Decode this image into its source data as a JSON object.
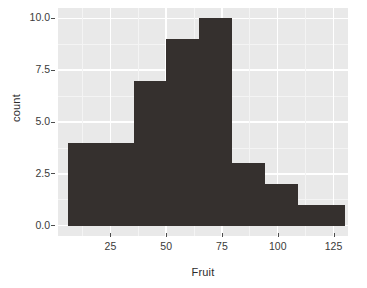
{
  "chart_data": {
    "type": "bar",
    "title": "",
    "subtitle": "",
    "xlabel": "Fruit",
    "ylabel": "count",
    "xlim": [
      1.5,
      131.5
    ],
    "ylim": [
      -0.5,
      10.5
    ],
    "xticks": [
      25,
      50,
      75,
      100,
      125
    ],
    "xtick_labels": [
      "25",
      "50",
      "75",
      "100",
      "125"
    ],
    "yticks": [
      0.0,
      2.5,
      5.0,
      7.5,
      10.0
    ],
    "ytick_labels": [
      "0.0",
      "2.5",
      "5.0",
      "7.5",
      "10.0"
    ],
    "grid": true,
    "legend": false,
    "bar_color": "#35302e",
    "panel_color": "#e9e9e9",
    "grid_color": "#ffffff",
    "bin_edges": [
      5.8,
      35.4,
      50.1,
      64.9,
      79.7,
      94.4,
      109.2,
      124.0,
      130.0
    ],
    "bins": [
      {
        "x0": 5.8,
        "x1": 35.4,
        "count": 4
      },
      {
        "x0": 35.4,
        "x1": 50.1,
        "count": 7
      },
      {
        "x0": 50.1,
        "x1": 64.9,
        "count": 9
      },
      {
        "x0": 64.9,
        "x1": 79.7,
        "count": 10
      },
      {
        "x0": 79.7,
        "x1": 94.4,
        "count": 3
      },
      {
        "x0": 94.4,
        "x1": 109.2,
        "count": 2
      },
      {
        "x0": 109.2,
        "x1": 124.0,
        "count": 1
      },
      {
        "x0": 124.0,
        "x1": 130.0,
        "count": 1
      }
    ],
    "categories": [
      "5.8-35.4",
      "35.4-50.1",
      "50.1-64.9",
      "64.9-79.7",
      "79.7-94.4",
      "94.4-109.2",
      "109.2-124.0",
      "124.0-130.0"
    ],
    "values": [
      4,
      7,
      9,
      10,
      3,
      2,
      1,
      1
    ]
  }
}
